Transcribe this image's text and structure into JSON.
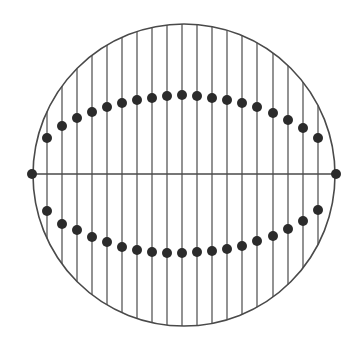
{
  "diagram": {
    "type": "circle-with-vertical-chords",
    "canvas": {
      "width": 358,
      "height": 354
    },
    "colors": {
      "background": "#ffffff",
      "stroke": "#4a4a4a",
      "dot": "#2b2b2b"
    },
    "circle": {
      "cx": 184,
      "cy": 175,
      "r": 151,
      "stroke_width": 1.6
    },
    "horizontal_diameter": {
      "y": 174,
      "x1": 32,
      "x2": 336,
      "stroke_width": 1.3
    },
    "endpoint_dots": [
      {
        "x": 32,
        "y": 174
      },
      {
        "x": 336,
        "y": 174
      }
    ],
    "vertical_lines": {
      "stroke_width": 1.2,
      "x": [
        47,
        62,
        77,
        92,
        107,
        122,
        137,
        152,
        167,
        182,
        197,
        212,
        227,
        242,
        257,
        273,
        288,
        303,
        318
      ]
    },
    "dot_radius": 5,
    "upper_dots_y": [
      138,
      126,
      118,
      112,
      107,
      103,
      100,
      98,
      96,
      95,
      96,
      98,
      100,
      103,
      107,
      113,
      120,
      128,
      138
    ],
    "lower_dots_y": [
      211,
      224,
      230,
      237,
      242,
      247,
      250,
      252,
      253,
      253,
      252,
      251,
      249,
      246,
      241,
      236,
      229,
      221,
      210
    ]
  }
}
